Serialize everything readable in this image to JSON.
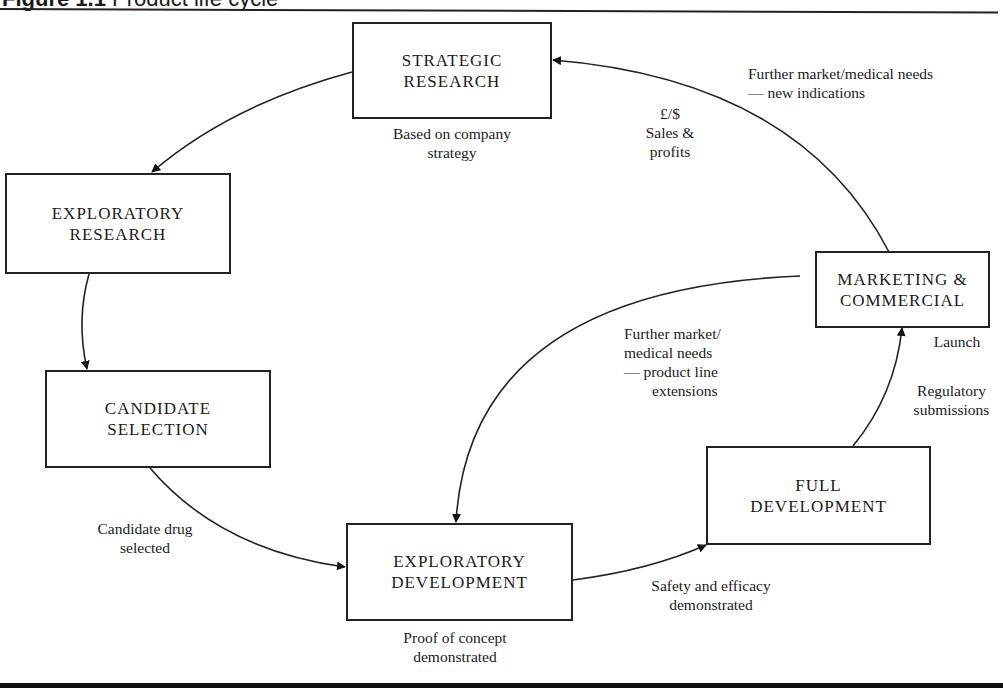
{
  "figure": {
    "number": "Figure 1.1",
    "title": "Product life cycle"
  },
  "nodes": [
    {
      "id": "strategic_research",
      "line1": "STRATEGIC",
      "line2": "RESEARCH"
    },
    {
      "id": "exploratory_research",
      "line1": "EXPLORATORY",
      "line2": "RESEARCH"
    },
    {
      "id": "candidate_selection",
      "line1": "CANDIDATE",
      "line2": "SELECTION"
    },
    {
      "id": "exploratory_development",
      "line1": "EXPLORATORY",
      "line2": "DEVELOPMENT"
    },
    {
      "id": "full_development",
      "line1": "FULL",
      "line2": "DEVELOPMENT"
    },
    {
      "id": "marketing_commercial",
      "line1": "MARKETING &",
      "line2": "COMMERCIAL"
    }
  ],
  "annotations": {
    "strategy": {
      "line1": "Based on company",
      "line2": "strategy"
    },
    "sales": {
      "line1": "£/$",
      "line2": "Sales &",
      "line3": "profits"
    },
    "new_indications": {
      "line1": "Further market/medical needs",
      "line2": "— new indications"
    },
    "candidate_drug": {
      "line1": "Candidate drug",
      "line2": "selected"
    },
    "proof_of_concept": {
      "line1": "Proof of concept",
      "line2": "demonstrated"
    },
    "safety_efficacy": {
      "line1": "Safety and efficacy",
      "line2": "demonstrated"
    },
    "product_line": {
      "line1": "Further market/",
      "line2": "medical needs",
      "line3": "— product line",
      "line4": "extensions"
    },
    "launch": {
      "line1": "Launch"
    },
    "regulatory": {
      "line1": "Regulatory",
      "line2": "submissions"
    }
  },
  "edges": [
    {
      "from": "strategic_research",
      "to": "exploratory_research"
    },
    {
      "from": "exploratory_research",
      "to": "candidate_selection"
    },
    {
      "from": "candidate_selection",
      "to": "exploratory_development",
      "label": "Candidate drug selected"
    },
    {
      "from": "exploratory_development",
      "to": "full_development",
      "label": "Safety and efficacy demonstrated"
    },
    {
      "from": "full_development",
      "to": "marketing_commercial",
      "label": "Regulatory submissions"
    },
    {
      "from": "marketing_commercial",
      "to": "strategic_research",
      "label": "Further market/medical needs — new indications"
    },
    {
      "from": "marketing_commercial",
      "to": "exploratory_development",
      "label": "Further market/medical needs — product line extensions"
    }
  ]
}
